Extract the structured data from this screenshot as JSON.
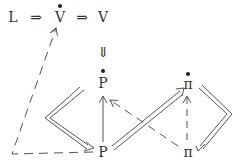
{
  "diagram": {
    "top_row": {
      "L": "L",
      "arrow1": "⇒",
      "V_dot": "V",
      "arrow2": "⇒",
      "V": "V"
    },
    "down_arrow": "⇓",
    "nodes": {
      "P_dot": "P",
      "P": "P",
      "pi_dot": "π",
      "pi": "π"
    },
    "edges": [
      {
        "from": "P",
        "to": "V_dot",
        "style": "dashed",
        "route": "left-loop"
      },
      {
        "from": "P",
        "to": "P_dot",
        "style": "solid-single"
      },
      {
        "from": "pi",
        "to": "P_dot",
        "style": "dashed"
      },
      {
        "from": "pi",
        "to": "pi_dot",
        "style": "dashed"
      },
      {
        "from": "P_dot",
        "to": "P",
        "style": "double",
        "route": "left-bend"
      },
      {
        "from": "P",
        "to": "pi_dot",
        "style": "double"
      },
      {
        "from": "pi_dot",
        "to": "pi",
        "style": "double",
        "route": "right-bend"
      }
    ]
  }
}
